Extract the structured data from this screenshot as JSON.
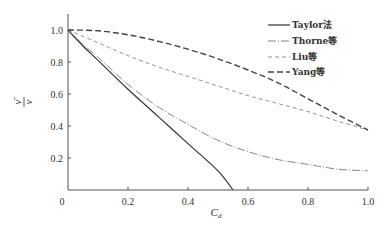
{
  "chart_data": {
    "type": "line",
    "title": "",
    "xlabel": "C_d",
    "xlabel_main": "C",
    "xlabel_sub": "d",
    "ylabel": "ν̄ / ν",
    "ylabel_num": "ν̄",
    "ylabel_den": "ν",
    "xlim": [
      0,
      1.0
    ],
    "ylim": [
      0,
      1.1
    ],
    "x_ticks": [
      "0",
      "0.2",
      "0.4",
      "0.6",
      "0.8",
      "1.0"
    ],
    "y_ticks": [
      "0.2",
      "0.4",
      "0.6",
      "0.8",
      "1.0"
    ],
    "origin_label": "0",
    "grid": false,
    "legend_position": "upper right",
    "series": [
      {
        "name": "Taylor法",
        "style": "solid",
        "color": "#333333",
        "x": [
          0,
          0.05,
          0.1,
          0.2,
          0.3,
          0.4,
          0.5,
          0.55
        ],
        "y": [
          1.0,
          0.9,
          0.81,
          0.63,
          0.46,
          0.29,
          0.12,
          0.0
        ]
      },
      {
        "name": "Thorne等",
        "style": "dash-dot",
        "color": "#666666",
        "x": [
          0,
          0.05,
          0.1,
          0.2,
          0.3,
          0.4,
          0.5,
          0.6,
          0.7,
          0.8,
          0.9,
          1.0
        ],
        "y": [
          1.0,
          0.91,
          0.83,
          0.66,
          0.52,
          0.41,
          0.31,
          0.24,
          0.19,
          0.16,
          0.13,
          0.12
        ]
      },
      {
        "name": "Liu等",
        "style": "dashed",
        "color": "#777777",
        "x": [
          0,
          0.1,
          0.2,
          0.3,
          0.4,
          0.5,
          0.6,
          0.7,
          0.8,
          0.9,
          1.0
        ],
        "y": [
          1.0,
          0.92,
          0.84,
          0.77,
          0.71,
          0.65,
          0.59,
          0.54,
          0.49,
          0.43,
          0.375
        ]
      },
      {
        "name": "Yang等",
        "style": "long-dash",
        "color": "#444444",
        "x": [
          0,
          0.1,
          0.2,
          0.3,
          0.4,
          0.5,
          0.6,
          0.7,
          0.8,
          0.9,
          1.0
        ],
        "y": [
          1.0,
          0.995,
          0.97,
          0.93,
          0.88,
          0.82,
          0.75,
          0.67,
          0.57,
          0.47,
          0.375
        ]
      }
    ]
  }
}
